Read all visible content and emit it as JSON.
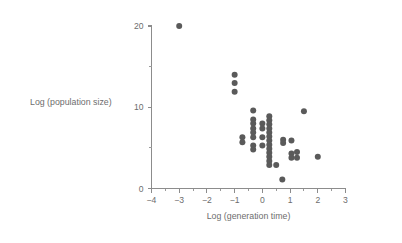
{
  "chart_data": {
    "type": "scatter",
    "title": "",
    "xlabel": "Log (generation time)",
    "ylabel": "Log (population size)",
    "xlim": [
      -4,
      3
    ],
    "ylim": [
      0,
      20
    ],
    "xticks": [
      -4,
      -3,
      -2,
      -1,
      0,
      1,
      2,
      3
    ],
    "xticklabels": [
      "−4",
      "−3",
      "−2",
      "−1",
      "0",
      "1",
      "2",
      "3"
    ],
    "xminorticks": [
      -3.5,
      -2.5,
      -1.5,
      -0.5,
      0.5,
      1.5,
      2.5
    ],
    "yticks": [
      0,
      10,
      20
    ],
    "yticklabels": [
      "0",
      "10",
      "20"
    ],
    "yminorticks": [
      5,
      15
    ],
    "grid": false,
    "legend": null,
    "marker": "circle",
    "marker_color": "#5a5a5a",
    "marker_size": 3.0,
    "points": [
      {
        "x": -3.0,
        "y": 20.0
      },
      {
        "x": -1.0,
        "y": 14.0
      },
      {
        "x": -1.0,
        "y": 13.0
      },
      {
        "x": -1.0,
        "y": 11.9
      },
      {
        "x": -0.72,
        "y": 6.3
      },
      {
        "x": -0.72,
        "y": 5.7
      },
      {
        "x": -0.33,
        "y": 9.6
      },
      {
        "x": -0.33,
        "y": 8.5
      },
      {
        "x": -0.33,
        "y": 8.0
      },
      {
        "x": -0.33,
        "y": 7.4
      },
      {
        "x": -0.33,
        "y": 6.9
      },
      {
        "x": -0.33,
        "y": 6.3
      },
      {
        "x": -0.33,
        "y": 5.3
      },
      {
        "x": -0.33,
        "y": 4.8
      },
      {
        "x": 0.0,
        "y": 8.0
      },
      {
        "x": 0.0,
        "y": 7.4
      },
      {
        "x": 0.0,
        "y": 6.3
      },
      {
        "x": 0.0,
        "y": 5.3
      },
      {
        "x": 0.25,
        "y": 8.9
      },
      {
        "x": 0.25,
        "y": 8.4
      },
      {
        "x": 0.25,
        "y": 7.9
      },
      {
        "x": 0.25,
        "y": 7.4
      },
      {
        "x": 0.25,
        "y": 6.9
      },
      {
        "x": 0.25,
        "y": 6.4
      },
      {
        "x": 0.25,
        "y": 5.9
      },
      {
        "x": 0.25,
        "y": 5.4
      },
      {
        "x": 0.25,
        "y": 4.9
      },
      {
        "x": 0.25,
        "y": 4.4
      },
      {
        "x": 0.25,
        "y": 3.9
      },
      {
        "x": 0.25,
        "y": 3.4
      },
      {
        "x": 0.25,
        "y": 2.9
      },
      {
        "x": 0.5,
        "y": 2.9
      },
      {
        "x": 0.72,
        "y": 1.1
      },
      {
        "x": 0.75,
        "y": 6.0
      },
      {
        "x": 0.75,
        "y": 5.6
      },
      {
        "x": 1.05,
        "y": 5.9
      },
      {
        "x": 1.05,
        "y": 4.3
      },
      {
        "x": 1.05,
        "y": 3.8
      },
      {
        "x": 1.25,
        "y": 4.5
      },
      {
        "x": 1.25,
        "y": 3.8
      },
      {
        "x": 1.5,
        "y": 9.5
      },
      {
        "x": 2.0,
        "y": 3.9
      }
    ]
  }
}
